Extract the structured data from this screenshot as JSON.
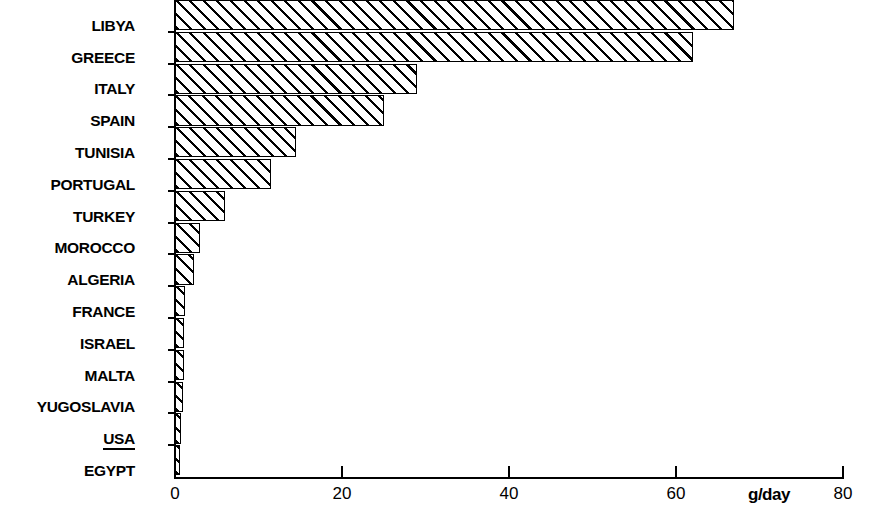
{
  "chart_data": {
    "type": "bar",
    "orientation": "horizontal",
    "title": "",
    "subtitle": "",
    "xlabel": "g/day",
    "ylabel": "",
    "categories": [
      "LIBYA",
      "GREECE",
      "ITALY",
      "SPAIN",
      "TUNISIA",
      "PORTUGAL",
      "TURKEY",
      "MOROCCO",
      "ALGERIA",
      "FRANCE",
      "ISRAEL",
      "MALTA",
      "YUGOSLAVIA",
      "USA",
      "EGYPT"
    ],
    "values": [
      67,
      62,
      29,
      25,
      14.5,
      11.5,
      6,
      3,
      2.3,
      1.2,
      1.1,
      1.1,
      0.9,
      0.7,
      0.5
    ],
    "xlim": [
      0,
      80
    ],
    "x_ticks": [
      0,
      20,
      40,
      60,
      80
    ],
    "x_tick_labels": [
      "0",
      "20",
      "40",
      "60",
      "80"
    ],
    "grid": false,
    "legend": false,
    "bar_style": {
      "fill": "#ffffff",
      "hatch": "diagonal-45",
      "edge_color": "#000000"
    },
    "highlighted_categories": [
      "USA"
    ]
  },
  "axis": {
    "unit_label": "g/day"
  }
}
